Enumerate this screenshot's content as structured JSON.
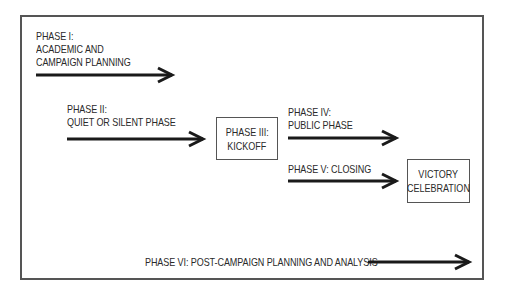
{
  "diagram": {
    "type": "campaign-phase-flow",
    "phases": [
      {
        "id": "phase1",
        "lines": [
          "PHASE I:",
          "ACADEMIC AND",
          "CAMPAIGN PLANNING"
        ],
        "kind": "arrow"
      },
      {
        "id": "phase2",
        "lines": [
          "PHASE II:",
          "QUIET OR SILENT PHASE"
        ],
        "kind": "arrow"
      },
      {
        "id": "phase3",
        "lines": [
          "PHASE III:",
          "KICKOFF"
        ],
        "kind": "box"
      },
      {
        "id": "phase4",
        "lines": [
          "PHASE IV:",
          "PUBLIC PHASE"
        ],
        "kind": "arrow"
      },
      {
        "id": "phase5",
        "lines": [
          "PHASE V: CLOSING"
        ],
        "kind": "arrow"
      },
      {
        "id": "victory",
        "lines": [
          "VICTORY",
          "CELEBRATION"
        ],
        "kind": "box"
      },
      {
        "id": "phase6",
        "lines": [
          "PHASE VI: POST-CAMPAIGN PLANNING AND ANALYSIS"
        ],
        "kind": "arrow"
      }
    ],
    "colors": {
      "border": "#555555",
      "arrow": "#1a1a1a",
      "text": "#2a2a2a",
      "background": "#ffffff"
    }
  }
}
